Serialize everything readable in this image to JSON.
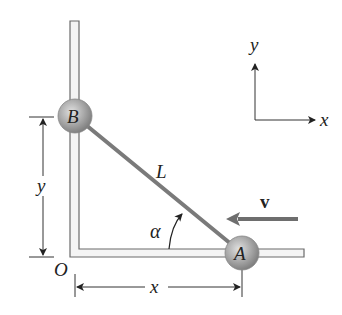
{
  "diagram": {
    "labels": {
      "ball_a": "A",
      "ball_b": "B",
      "rod_length": "L",
      "angle": "α",
      "velocity": "v",
      "origin": "O",
      "dim_x": "x",
      "dim_y": "y",
      "axis_x": "x",
      "axis_y": "y"
    },
    "colors": {
      "rod": "#7a7a7a",
      "wall_outline": "#6a6a6a",
      "wall_fill": "#f2f2f2",
      "ball": "#a8a8a8",
      "velocity_arrow": "#6e6e6e",
      "text": "#222222"
    }
  }
}
